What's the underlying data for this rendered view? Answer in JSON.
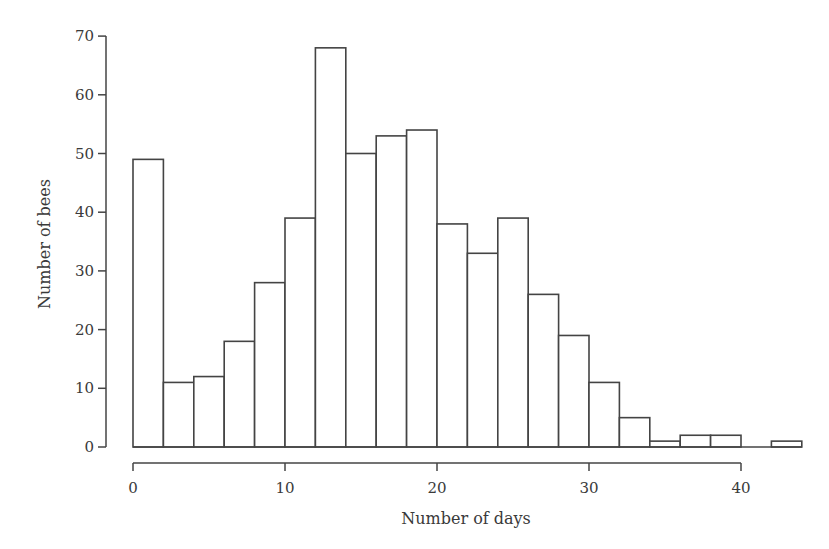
{
  "chart_data": {
    "type": "bar",
    "subtype": "histogram",
    "title": "",
    "xlabel": "Number of days",
    "ylabel": "Number of bees",
    "bin_width": 2,
    "bin_edges": [
      0,
      2,
      4,
      6,
      8,
      10,
      12,
      14,
      16,
      18,
      20,
      22,
      24,
      26,
      28,
      30,
      32,
      34,
      36,
      38,
      40,
      42,
      44
    ],
    "categories": [
      "0-2",
      "2-4",
      "4-6",
      "6-8",
      "8-10",
      "10-12",
      "12-14",
      "14-16",
      "16-18",
      "18-20",
      "20-22",
      "22-24",
      "24-26",
      "26-28",
      "28-30",
      "30-32",
      "32-34",
      "34-36",
      "36-38",
      "38-40",
      "40-42",
      "42-44"
    ],
    "values": [
      49,
      11,
      12,
      18,
      28,
      39,
      68,
      50,
      53,
      54,
      38,
      33,
      39,
      26,
      19,
      11,
      5,
      1,
      2,
      2,
      0,
      1
    ],
    "xlim": [
      0,
      44
    ],
    "ylim": [
      0,
      70
    ],
    "xticks": [
      0,
      10,
      20,
      30,
      40
    ],
    "yticks": [
      0,
      10,
      20,
      30,
      40,
      50,
      60,
      70
    ],
    "xtick_labels": [
      "0",
      "10",
      "20",
      "30",
      "40"
    ],
    "ytick_labels": [
      "0",
      "10",
      "20",
      "30",
      "40",
      "50",
      "60",
      "70"
    ],
    "grid": false,
    "legend": null,
    "bar_fill": "#ffffff",
    "bar_stroke": "#444444"
  }
}
